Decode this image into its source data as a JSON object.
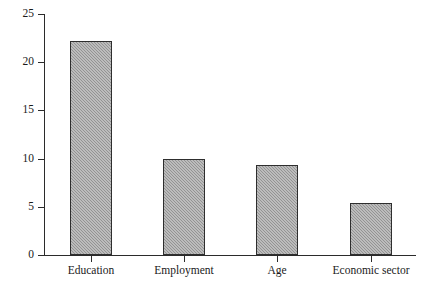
{
  "chart_data": {
    "type": "bar",
    "title": "",
    "xlabel": "",
    "ylabel": "",
    "categories": [
      "Education",
      "Employment",
      "Age",
      "Economic sector"
    ],
    "values": [
      22.2,
      10.0,
      9.3,
      5.4
    ],
    "ylim": [
      0,
      25
    ],
    "yticks": [
      0,
      5,
      10,
      15,
      20,
      25
    ],
    "ytick_labels": [
      "0",
      "5",
      "10",
      "15",
      "20",
      "25"
    ],
    "grid": false,
    "legend": null,
    "bar_fill_color": "#9b9b9b",
    "bar_border_color": "#2e2e2e",
    "axis_color": "#2b2b2b",
    "background_color": "#ffffff"
  },
  "axes": {
    "y_axis_name": "y-axis",
    "x_axis_name": "x-axis"
  }
}
